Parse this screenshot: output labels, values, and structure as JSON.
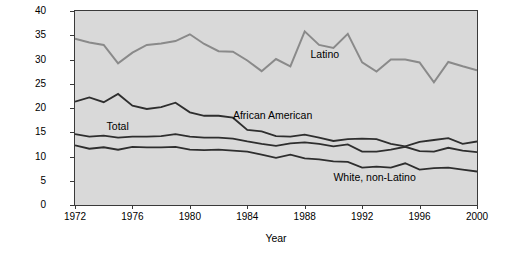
{
  "chart_data": {
    "type": "line",
    "title": "",
    "xlabel": "Year",
    "ylabel": "Percent of 16- to 24-year-olds who have dropped out of school",
    "xlim": [
      1972,
      2000
    ],
    "ylim": [
      0,
      40
    ],
    "xticks": [
      1972,
      1976,
      1980,
      1984,
      1988,
      1992,
      1996,
      2000
    ],
    "yticks": [
      0,
      5,
      10,
      15,
      20,
      25,
      30,
      35,
      40
    ],
    "grid": false,
    "legend": "inline-labels",
    "x": [
      1972,
      1973,
      1974,
      1975,
      1976,
      1977,
      1978,
      1979,
      1980,
      1981,
      1982,
      1983,
      1984,
      1985,
      1986,
      1987,
      1988,
      1989,
      1990,
      1991,
      1992,
      1993,
      1994,
      1995,
      1996,
      1997,
      1998,
      1999,
      2000
    ],
    "series": [
      {
        "name": "Latino",
        "color": "#8a8a8a",
        "values": [
          34.3,
          33.5,
          33.0,
          29.2,
          31.4,
          33.0,
          33.3,
          33.8,
          35.2,
          33.2,
          31.7,
          31.6,
          29.8,
          27.6,
          30.1,
          28.6,
          35.8,
          33.0,
          32.4,
          35.3,
          29.4,
          27.5,
          30.0,
          30.0,
          29.4,
          25.3,
          29.5,
          28.6,
          27.8
        ]
      },
      {
        "name": "African American",
        "color": "#2e2e2e",
        "values": [
          21.3,
          22.2,
          21.2,
          22.9,
          20.5,
          19.8,
          20.2,
          21.1,
          19.1,
          18.4,
          18.4,
          18.0,
          15.5,
          15.2,
          14.2,
          14.1,
          14.5,
          13.9,
          13.2,
          13.6,
          13.7,
          13.6,
          12.6,
          12.1,
          13.0,
          13.4,
          13.8,
          12.6,
          13.1
        ]
      },
      {
        "name": "Total",
        "color": "#2e2e2e",
        "values": [
          14.6,
          14.1,
          14.3,
          13.9,
          14.1,
          14.1,
          14.2,
          14.6,
          14.1,
          13.9,
          13.9,
          13.7,
          13.1,
          12.6,
          12.2,
          12.7,
          12.9,
          12.6,
          12.1,
          12.5,
          11.0,
          11.0,
          11.4,
          12.0,
          11.1,
          11.0,
          11.8,
          11.2,
          10.9
        ]
      },
      {
        "name": "White, non-Latino",
        "color": "#2e2e2e",
        "values": [
          12.3,
          11.6,
          11.9,
          11.4,
          12.0,
          11.9,
          11.9,
          12.0,
          11.4,
          11.3,
          11.4,
          11.2,
          11.0,
          10.4,
          9.7,
          10.4,
          9.6,
          9.4,
          9.0,
          8.9,
          7.7,
          7.9,
          7.7,
          8.6,
          7.3,
          7.6,
          7.7,
          7.3,
          6.9
        ]
      }
    ],
    "annotations": [
      {
        "text": "Latino",
        "x": 1988.4,
        "y": 31.0
      },
      {
        "text": "African American",
        "x": 1983.0,
        "y": 18.3
      },
      {
        "text": "Total",
        "x": 1974.2,
        "y": 16.1
      },
      {
        "text": "White, non-Latino",
        "x": 1990.0,
        "y": 5.6
      }
    ]
  }
}
